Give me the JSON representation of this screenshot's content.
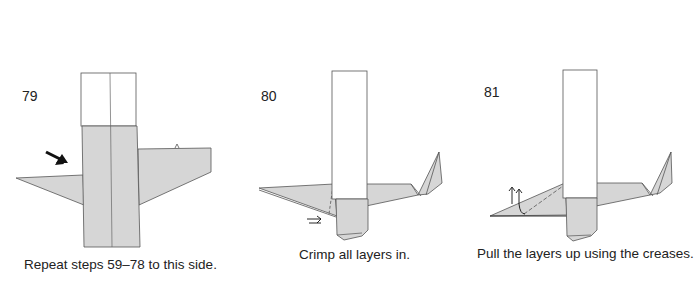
{
  "steps": [
    {
      "number": "79",
      "caption": "Repeat steps 59–78 to this side.",
      "arrow": "push-in-arrow"
    },
    {
      "number": "80",
      "caption": "Crimp all layers in.",
      "arrow": "crimp-arrow"
    },
    {
      "number": "81",
      "caption": "Pull the layers up using the creases.",
      "arrow": "pull-up-arrows"
    }
  ],
  "colors": {
    "paper_gray": "#d6d6d6",
    "paper_white": "#ffffff",
    "line": "#555555",
    "arrow": "#111111"
  }
}
